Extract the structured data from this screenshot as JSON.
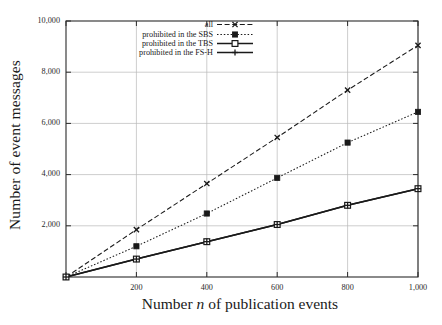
{
  "chart_data": {
    "type": "line",
    "title": "",
    "subtitle": "",
    "xlabel_full": "Number n of publication events",
    "xlabel_prefix": "Number ",
    "xlabel_italic": "n",
    "xlabel_suffix": " of publication events",
    "ylabel": "Number of event messages",
    "x": [
      0,
      200,
      400,
      600,
      800,
      1000
    ],
    "xlim": [
      0,
      1000
    ],
    "ylim": [
      0,
      10000
    ],
    "xticks": [
      0,
      200,
      400,
      600,
      800,
      1000
    ],
    "xtick_labels": [
      "",
      "200",
      "400",
      "600",
      "800",
      "1,000"
    ],
    "yticks": [
      2000,
      4000,
      6000,
      8000,
      10000
    ],
    "ytick_labels": [
      "2,000",
      "4,000",
      "6,000",
      "8,000",
      "10,000"
    ],
    "grid": true,
    "grid_axis": "both",
    "legend_position": "top-center-right",
    "series": [
      {
        "name": "all",
        "marker": "x-cross",
        "linestyle": "dashed",
        "color": "#1a1a1a",
        "values": [
          0,
          1850,
          3650,
          5450,
          7300,
          9050
        ]
      },
      {
        "name": "prohibited in the SBS",
        "marker": "filled-square",
        "linestyle": "dotted",
        "color": "#1a1a1a",
        "values": [
          0,
          1200,
          2480,
          3870,
          5250,
          6450
        ]
      },
      {
        "name": "prohibited in the TBS",
        "marker": "open-square",
        "linestyle": "solid",
        "color": "#1a1a1a",
        "values": [
          0,
          700,
          1380,
          2050,
          2800,
          3450
        ]
      },
      {
        "name": "prohibited in the FS-H",
        "marker": "plus",
        "linestyle": "solid",
        "color": "#1a1a1a",
        "values": [
          0,
          700,
          1380,
          2050,
          2800,
          3450
        ]
      }
    ]
  },
  "colors": {
    "ink": "#1a1a1a",
    "frame": "#2b2b2b",
    "grid": "#b9b9b9",
    "background": "#ffffff"
  },
  "legend": {
    "entries": [
      {
        "label": "all"
      },
      {
        "label": "prohibited in the SBS"
      },
      {
        "label": "prohibited in the TBS"
      },
      {
        "label": "prohibited in the FS-H"
      }
    ]
  }
}
